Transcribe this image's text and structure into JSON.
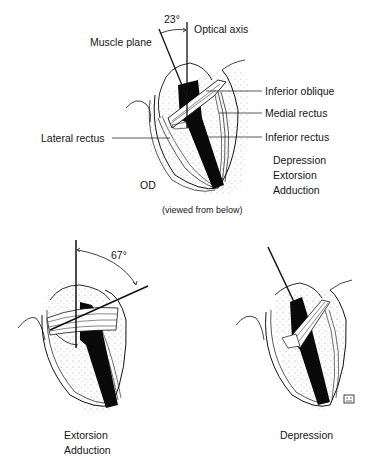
{
  "figure": {
    "top_panel": {
      "angle_label": "23°",
      "axis_labels": {
        "optical_axis": "Optical axis",
        "muscle_plane": "Muscle plane"
      },
      "muscle_labels": {
        "inferior_oblique": "Inferior oblique",
        "medial_rectus": "Medial rectus",
        "inferior_rectus": "Inferior rectus",
        "lateral_rectus": "Lateral rectus"
      },
      "eye_label": "OD",
      "actions": [
        "Depression",
        "Extorsion",
        "Adduction"
      ],
      "view_note": "(viewed from below)"
    },
    "bottom_left_panel": {
      "angle_label": "67°",
      "actions": [
        "Extorsion",
        "Adduction"
      ]
    },
    "bottom_right_panel": {
      "actions": [
        "Depression"
      ]
    }
  },
  "colors": {
    "ink": "#111111",
    "muscle": "#0a0a0a",
    "background": "#ffffff",
    "stipple": "#8a8a8a"
  }
}
